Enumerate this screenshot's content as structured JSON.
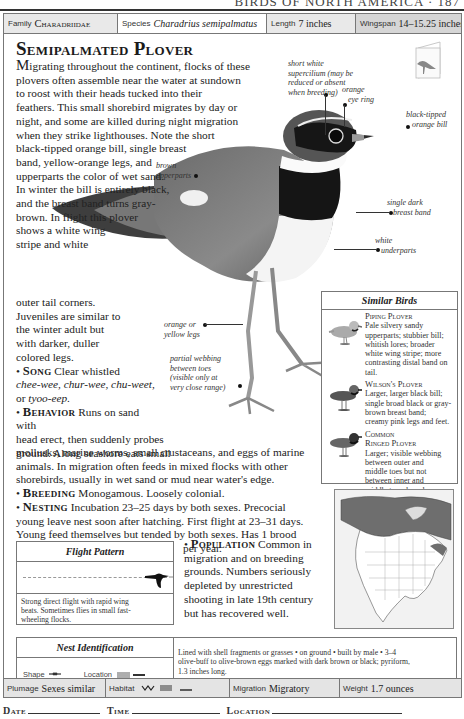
{
  "running_head": "BIRDS OF NORTH AMERICA · 187",
  "header": {
    "family": {
      "label": "Family",
      "value": "Charadriidae"
    },
    "species": {
      "label": "Species",
      "value": "Charadrius semipalmatus"
    },
    "length": {
      "label": "Length",
      "value": "7 inches"
    },
    "wingspan": {
      "label": "Wingspan",
      "value": "14–15.25 inches"
    }
  },
  "title": "Semipalmated Plover",
  "intro": {
    "lead": "M",
    "lines": [
      "igrating throughout the continent, flocks of these",
      "plovers often assemble near the water at sundown",
      "to roost with their heads tucked into their",
      "feathers. This small shorebird migrates by day or",
      "night, and some are killed during night migration",
      "when they strike lighthouses. Note the short",
      "black-tipped orange bill, single breast",
      "band, yellow-orange legs, and",
      "upperparts the color of wet sand.",
      "In winter the bill is entirely black,",
      "and the breast band turns gray-",
      "brown. In flight this plover",
      "shows a white wing",
      "stripe and white"
    ],
    "continued": [
      "outer tail corners.",
      "Juveniles are similar to",
      "the winter adult but",
      "with darker, duller",
      "colored legs."
    ]
  },
  "sections": {
    "song": {
      "heading": "Song",
      "text": "Clear whistled",
      "calls": "chee-wee, chur-wee, chu-weet,",
      "calls_end_prefix": "or",
      "calls_end": "tyoo-eep."
    },
    "behavior": {
      "heading": "Behavior",
      "lines": [
        "Runs on sand with",
        "head erect, then suddenly probes",
        "ground. Along seashore eats small",
        "mollusks, marine worms, small crustaceans, and eggs of marine",
        "animals. In migration often feeds in mixed flocks with other",
        "shorebirds, usually in wet sand or mud near water's edge."
      ]
    },
    "breeding": {
      "heading": "Breeding",
      "text": "Monogamous. Loosely colonial."
    },
    "nesting": {
      "heading": "Nesting",
      "lines": [
        "Incubation 23–25 days by both sexes. Precocial",
        "young leave nest soon after hatching. First flight at 23–31 days.",
        "Young feed themselves but tended by both sexes. Has 1 brood",
        "per year."
      ]
    },
    "population": {
      "heading": "Population",
      "lines": [
        "Common in",
        "migration and on breeding",
        "grounds. Numbers seriously",
        "depleted by unrestricted",
        "shooting in late 19th century",
        "but has recovered well."
      ]
    }
  },
  "annotations": {
    "supercilium": [
      "short white",
      "supercilium (may be",
      "reduced or absent",
      "when breeding)"
    ],
    "eye_ring": [
      "orange",
      "eye ring"
    ],
    "bill": [
      "black-tipped",
      "orange bill"
    ],
    "upperparts": [
      "brown",
      "upperparts"
    ],
    "breast_band": [
      "single dark",
      "breast band"
    ],
    "underparts": [
      "white",
      "underparts"
    ],
    "legs": [
      "orange or",
      "yellow legs"
    ],
    "webbing": [
      "partial webbing",
      "between toes",
      "(visible only at",
      "very close range)"
    ]
  },
  "similar_birds": {
    "title": "Similar Birds",
    "items": [
      {
        "name": "Piping Plover",
        "lines": [
          "Pale silvery sandy",
          "upperparts; stubbier bill;",
          "whitish lores; broader",
          "white wing stripe; more",
          "contrasting distal band on",
          "tail."
        ]
      },
      {
        "name": "Wilson's Plover",
        "lines": [
          "Larger, larger black bill;",
          "single broad black or gray-",
          "brown breast band;",
          "creamy pink legs and feet."
        ]
      },
      {
        "name_lines": [
          "Common",
          "Ringed Plover"
        ],
        "lines": [
          "Larger; visible webbing",
          "between outer and",
          "middle toes but not",
          "between inner and",
          "middle toes; broader",
          "breast band; longer white",
          "supercilium; different call."
        ]
      }
    ]
  },
  "flight_pattern": {
    "title": "Flight Pattern",
    "description": [
      "Strong direct flight with rapid wing",
      "beats. Sometimes flies in small fast-",
      "wheeling flocks."
    ]
  },
  "nest_identification": {
    "title": "Nest Identification",
    "shape_label": "Shape",
    "location_label": "Location",
    "description": [
      "Lined with shell fragments or grasses • on ground • built by male • 3–4",
      "olive-buff to olive-brown eggs marked with dark brown or black; pyriform,",
      "1.3 inches long."
    ]
  },
  "footer": {
    "plumage": {
      "label": "Plumage",
      "value": "Sexes similar"
    },
    "habitat": {
      "label": "Habitat"
    },
    "migration": {
      "label": "Migration",
      "value": "Migratory"
    },
    "weight": {
      "label": "Weight",
      "value": "1.7 ounces"
    }
  },
  "log": {
    "date": "Date",
    "time": "Time",
    "location": "Location"
  },
  "colors": {
    "header_gray": "#e9e9e9",
    "wingspan_gray": "#d6d6d6",
    "map_range": "#6e6e6e",
    "border": "#777777"
  }
}
